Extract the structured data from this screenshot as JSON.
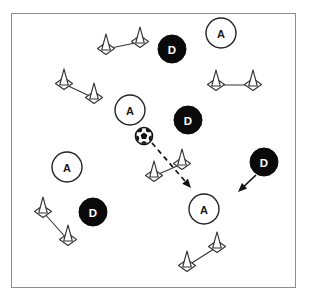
{
  "diagram": {
    "type": "soccer-training-drill",
    "canvas": {
      "width": 312,
      "height": 297
    },
    "field": {
      "x": 11,
      "y": 13,
      "width": 285,
      "height": 275,
      "border_color": "#8d8d8d",
      "background_color": "#ffffff"
    },
    "legend": {
      "attacker_symbol": "A",
      "defender_symbol": "D"
    },
    "colors": {
      "attacker_fill": "#ffffff",
      "attacker_stroke": "#222222",
      "defender_fill": "#0a0a0a",
      "defender_text": "#ffffff",
      "cone_stroke": "#333333",
      "arrow_color": "#111111"
    }
  },
  "attackers": [
    {
      "id": "a-top-right",
      "label": "A",
      "x": 221,
      "y": 33,
      "r": 15
    },
    {
      "id": "a-center",
      "label": "A",
      "x": 130,
      "y": 110,
      "r": 15
    },
    {
      "id": "a-left-middle",
      "label": "A",
      "x": 67,
      "y": 167,
      "r": 15
    },
    {
      "id": "a-bottom-center",
      "label": "A",
      "x": 204,
      "y": 209,
      "r": 15
    }
  ],
  "defenders": [
    {
      "id": "d-top",
      "label": "D",
      "x": 172,
      "y": 49,
      "r": 14
    },
    {
      "id": "d-middle",
      "label": "D",
      "x": 188,
      "y": 120,
      "r": 14
    },
    {
      "id": "d-right",
      "label": "D",
      "x": 264,
      "y": 162,
      "r": 14
    },
    {
      "id": "d-bottom-left",
      "label": "D",
      "x": 93,
      "y": 212,
      "r": 14
    }
  ],
  "ball": {
    "id": "soccer-ball",
    "x": 144,
    "y": 136,
    "r": 8.5
  },
  "cone_gates": [
    {
      "id": "gate-top",
      "cone_a": {
        "x": 106,
        "y": 45
      },
      "cone_b": {
        "x": 140,
        "y": 38
      }
    },
    {
      "id": "gate-upper-left",
      "cone_a": {
        "x": 64,
        "y": 80
      },
      "cone_b": {
        "x": 94,
        "y": 94
      }
    },
    {
      "id": "gate-upper-right",
      "cone_a": {
        "x": 216,
        "y": 81
      },
      "cone_b": {
        "x": 253,
        "y": 81
      }
    },
    {
      "id": "gate-center",
      "cone_a": {
        "x": 154,
        "y": 172
      },
      "cone_b": {
        "x": 182,
        "y": 160
      }
    },
    {
      "id": "gate-bottom-left",
      "cone_a": {
        "x": 43,
        "y": 208
      },
      "cone_b": {
        "x": 68,
        "y": 236
      }
    },
    {
      "id": "gate-bottom-right",
      "cone_a": {
        "x": 187,
        "y": 262
      },
      "cone_b": {
        "x": 217,
        "y": 243
      }
    }
  ],
  "arrows": [
    {
      "id": "pass-arrow",
      "style": "dashed",
      "from": {
        "x": 152,
        "y": 143
      },
      "to": {
        "x": 191,
        "y": 188
      },
      "meaning": "pass"
    },
    {
      "id": "defender-run-arrow",
      "style": "solid",
      "from": {
        "x": 256,
        "y": 175
      },
      "to": {
        "x": 238,
        "y": 192
      },
      "meaning": "defender-run"
    }
  ]
}
